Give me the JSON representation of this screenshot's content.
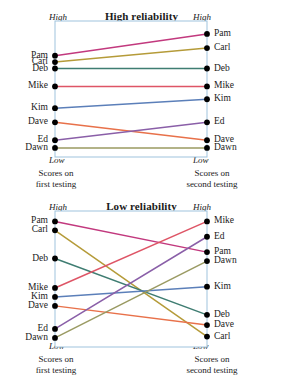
{
  "figure": {
    "axis_top_label": "High",
    "axis_bottom_label": "Low",
    "caption_left": "Scores on\nfirst testing",
    "caption_left_line1": "Scores on",
    "caption_left_line2": "first testing",
    "caption_right_line1": "Scores on",
    "caption_right_line2": "second testing",
    "frame_color": "#9fc3dd",
    "dot_color": "#000000"
  },
  "chart_data": [
    {
      "type": "line",
      "title": "High reliability",
      "xlabel": "",
      "ylabel": "",
      "x": [
        "Scores on first testing",
        "Scores on second testing"
      ],
      "axis_high": "High",
      "axis_low": "Low",
      "ylim": [
        0,
        100
      ],
      "grid": false,
      "legend": "none",
      "series": [
        {
          "name": "Pam",
          "color": "#c2397e",
          "values": [
            76,
            93
          ]
        },
        {
          "name": "Carl",
          "color": "#b59b39",
          "values": [
            71,
            82
          ]
        },
        {
          "name": "Deb",
          "color": "#3f7d72",
          "values": [
            66,
            66
          ]
        },
        {
          "name": "Mike",
          "color": "#de5566",
          "values": [
            52,
            52
          ]
        },
        {
          "name": "Kim",
          "color": "#5b7fb9",
          "values": [
            35,
            42
          ]
        },
        {
          "name": "Dave",
          "color": "#e8714a",
          "values": [
            24,
            10
          ]
        },
        {
          "name": "Ed",
          "color": "#8a5fa8",
          "values": [
            10,
            24
          ]
        },
        {
          "name": "Dawn",
          "color": "#9a9a62",
          "values": [
            4,
            4
          ]
        }
      ]
    },
    {
      "type": "line",
      "title": "Low reliability",
      "xlabel": "",
      "ylabel": "",
      "x": [
        "Scores on first testing",
        "Scores on second testing"
      ],
      "axis_high": "High",
      "axis_low": "Low",
      "ylim": [
        0,
        100
      ],
      "grid": false,
      "legend": "none",
      "series": [
        {
          "name": "Pam",
          "color": "#c2397e",
          "values": [
            95,
            71
          ]
        },
        {
          "name": "Carl",
          "color": "#b59b39",
          "values": [
            88,
            5
          ]
        },
        {
          "name": "Deb",
          "color": "#3f7d72",
          "values": [
            66,
            22
          ]
        },
        {
          "name": "Mike",
          "color": "#de5566",
          "values": [
            43,
            95
          ]
        },
        {
          "name": "Kim",
          "color": "#5b7fb9",
          "values": [
            36,
            44
          ]
        },
        {
          "name": "Dave",
          "color": "#e8714a",
          "values": [
            29,
            14
          ]
        },
        {
          "name": "Ed",
          "color": "#8a5fa8",
          "values": [
            11,
            83
          ]
        },
        {
          "name": "Dawn",
          "color": "#9a9a62",
          "values": [
            4,
            64
          ]
        }
      ]
    }
  ],
  "charts": [
    {
      "id": "high",
      "title": "High reliability",
      "left_labels": [
        {
          "name": "Pam",
          "y": 47
        },
        {
          "name": "Carl",
          "y": 57
        },
        {
          "name": "Deb",
          "y": 65
        },
        {
          "name": "Mike",
          "y": 87
        },
        {
          "name": "Kim",
          "y": 110
        },
        {
          "name": "Dave",
          "y": 124
        },
        {
          "name": "Ed",
          "y": 141
        },
        {
          "name": "Dawn",
          "y": 150
        }
      ],
      "right_labels": [
        {
          "name": "Pam",
          "y": 36
        },
        {
          "name": "Carl",
          "y": 52
        },
        {
          "name": "Deb",
          "y": 65
        },
        {
          "name": "Mike",
          "y": 87
        },
        {
          "name": "Kim",
          "y": 101
        },
        {
          "name": "Ed",
          "y": 124
        },
        {
          "name": "Dave",
          "y": 141
        },
        {
          "name": "Dawn",
          "y": 150
        }
      ]
    },
    {
      "id": "low",
      "title": "Low reliability",
      "left_labels": [
        {
          "name": "Pam",
          "y": 219
        },
        {
          "name": "Carl",
          "y": 229
        },
        {
          "name": "Deb",
          "y": 251
        },
        {
          "name": "Mike",
          "y": 273
        },
        {
          "name": "Kim",
          "y": 283
        },
        {
          "name": "Dave",
          "y": 293
        },
        {
          "name": "Ed",
          "y": 317
        },
        {
          "name": "Dawn",
          "y": 327
        }
      ],
      "right_labels": [
        {
          "name": "Mike",
          "y": 219
        },
        {
          "name": "Ed",
          "y": 237
        },
        {
          "name": "Pam",
          "y": 251
        },
        {
          "name": "Dawn",
          "y": 260
        },
        {
          "name": "Kim",
          "y": 281
        },
        {
          "name": "Deb",
          "y": 306
        },
        {
          "name": "Dave",
          "y": 317
        },
        {
          "name": "Carl",
          "y": 327
        }
      ]
    }
  ]
}
